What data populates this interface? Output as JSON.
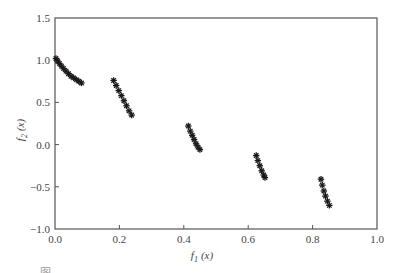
{
  "chart_data": {
    "type": "scatter",
    "title": "",
    "xlabel": "f1(x)",
    "ylabel": "f2(x)",
    "xlim": [
      0.0,
      1.0
    ],
    "ylim": [
      -1.0,
      1.5
    ],
    "x_ticks": [
      "0.0",
      "0.2",
      "0.4",
      "0.6",
      "0.8",
      "1.0"
    ],
    "y_ticks": [
      "1.5",
      "1.0",
      "0.5",
      "0.0",
      "-0.5",
      "-1.0"
    ],
    "grid": false,
    "legend": null,
    "marker": "star",
    "marker_color": "#1a1a1a",
    "series": [
      {
        "name": "Pareto front (5 disconnected segments)",
        "points": [
          [
            0.003,
            1.02
          ],
          [
            0.008,
            0.99
          ],
          [
            0.014,
            0.96
          ],
          [
            0.02,
            0.93
          ],
          [
            0.027,
            0.9
          ],
          [
            0.034,
            0.87
          ],
          [
            0.042,
            0.84
          ],
          [
            0.05,
            0.81
          ],
          [
            0.058,
            0.79
          ],
          [
            0.066,
            0.77
          ],
          [
            0.074,
            0.75
          ],
          [
            0.082,
            0.73
          ],
          [
            0.182,
            0.76
          ],
          [
            0.19,
            0.7
          ],
          [
            0.198,
            0.64
          ],
          [
            0.206,
            0.58
          ],
          [
            0.214,
            0.52
          ],
          [
            0.222,
            0.46
          ],
          [
            0.23,
            0.4
          ],
          [
            0.238,
            0.35
          ],
          [
            0.414,
            0.22
          ],
          [
            0.42,
            0.16
          ],
          [
            0.426,
            0.11
          ],
          [
            0.432,
            0.06
          ],
          [
            0.438,
            0.01
          ],
          [
            0.444,
            -0.03
          ],
          [
            0.45,
            -0.06
          ],
          [
            0.625,
            -0.13
          ],
          [
            0.63,
            -0.19
          ],
          [
            0.636,
            -0.25
          ],
          [
            0.642,
            -0.31
          ],
          [
            0.648,
            -0.36
          ],
          [
            0.652,
            -0.39
          ],
          [
            0.826,
            -0.41
          ],
          [
            0.83,
            -0.48
          ],
          [
            0.835,
            -0.55
          ],
          [
            0.84,
            -0.61
          ],
          [
            0.846,
            -0.67
          ],
          [
            0.852,
            -0.72
          ]
        ]
      }
    ]
  },
  "labels": {
    "xlabel_main": "f",
    "xlabel_sub": "1",
    "xlabel_arg": "(x)",
    "ylabel_main": "f",
    "ylabel_sub": "2",
    "ylabel_arg": "(x)"
  },
  "caption": "图 ..."
}
